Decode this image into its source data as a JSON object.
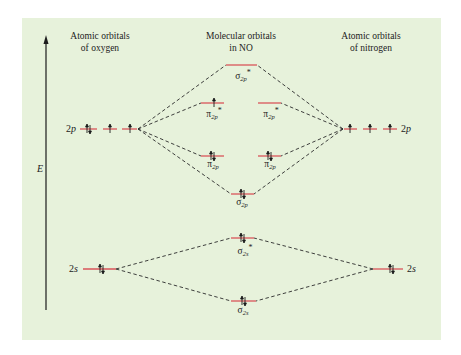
{
  "headers": {
    "left": [
      "Atomic orbitals",
      "of oxygen"
    ],
    "center": [
      "Molecular orbitals",
      "in NO"
    ],
    "right": [
      "Atomic orbitals",
      "of nitrogen"
    ]
  },
  "axis": {
    "label": "E",
    "direction": "up"
  },
  "atom_labels": {
    "oxygen_2p": {
      "num": "2",
      "orb": "p"
    },
    "nitrogen_2p": {
      "num": "2",
      "orb": "p"
    },
    "oxygen_2s": {
      "num": "2",
      "orb": "s"
    },
    "nitrogen_2s": {
      "num": "2",
      "orb": "s"
    }
  },
  "mo_labels": {
    "sigma2p_star": {
      "greek": "σ",
      "sub": "2p",
      "star": "*"
    },
    "pi2p_star_left": {
      "greek": "π",
      "sub": "2p",
      "star": "*"
    },
    "pi2p_star_right": {
      "greek": "π",
      "sub": "2p",
      "star": "*"
    },
    "pi2p_left": {
      "greek": "π",
      "sub": "2p",
      "star": ""
    },
    "pi2p_right": {
      "greek": "π",
      "sub": "2p",
      "star": ""
    },
    "sigma2p": {
      "greek": "σ",
      "sub": "2p",
      "star": ""
    },
    "sigma2s_star": {
      "greek": "σ",
      "sub": "2s",
      "star": "*"
    },
    "sigma2s": {
      "greek": "σ",
      "sub": "2s",
      "star": ""
    }
  },
  "colors": {
    "background": "#e7f2db",
    "level_line": "#d9545a",
    "connector": "#2a2a2a",
    "text": "#1c1c1c"
  },
  "electron_configuration": {
    "oxygen_2p": [
      "paired",
      "up",
      "up"
    ],
    "nitrogen_2p": [
      "up",
      "up",
      "up"
    ],
    "oxygen_2s": [
      "paired"
    ],
    "nitrogen_2s": [
      "paired"
    ],
    "sigma2p_star": "empty",
    "pi2p_star": [
      "up",
      "empty"
    ],
    "pi2p": [
      "paired",
      "paired"
    ],
    "sigma2p": "paired",
    "sigma2s_star": "paired",
    "sigma2s": "paired"
  }
}
